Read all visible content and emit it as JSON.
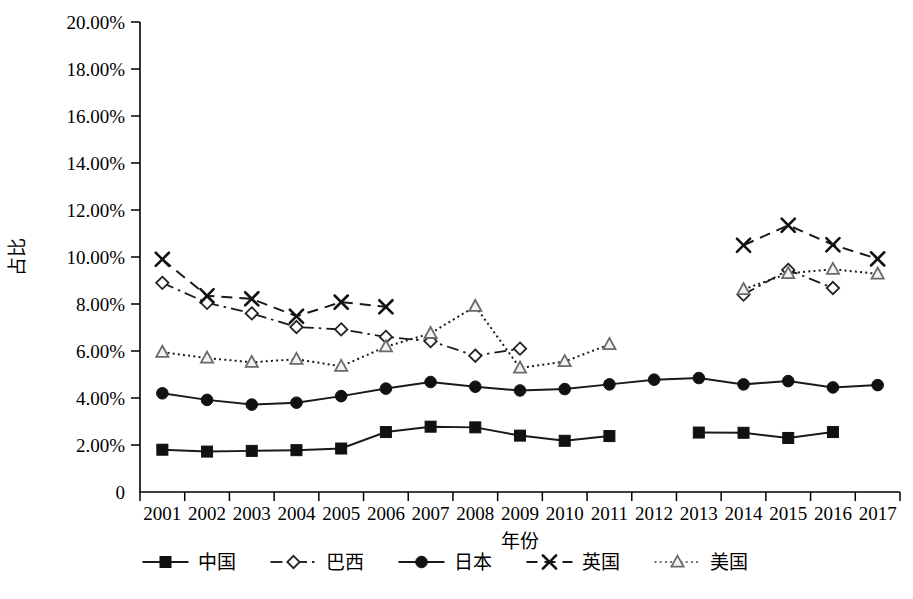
{
  "chart_data": {
    "type": "line",
    "title": "",
    "xlabel": "年份",
    "ylabel": "占比",
    "x": [
      "2001",
      "2002",
      "2003",
      "2004",
      "2005",
      "2006",
      "2007",
      "2008",
      "2009",
      "2010",
      "2011",
      "2012",
      "2013",
      "2014",
      "2015",
      "2016",
      "2017"
    ],
    "xtick_labels": [
      "2001",
      "2002",
      "2003",
      "2004",
      "2005",
      "2006",
      "2007",
      "2008",
      "2009",
      "2010",
      "2011",
      "2012",
      "2013",
      "2014",
      "2015",
      "2016",
      "2017"
    ],
    "ytick_labels": [
      "0",
      "2.00%",
      "4.00%",
      "6.00%",
      "8.00%",
      "10.00%",
      "12.00%",
      "14.00%",
      "16.00%",
      "18.00%",
      "20.00%"
    ],
    "ytick_values": [
      0,
      2,
      4,
      6,
      8,
      10,
      12,
      14,
      16,
      18,
      20
    ],
    "ylim": [
      0,
      20
    ],
    "yunit": "%",
    "grid": false,
    "legend_position": "bottom",
    "series": [
      {
        "name": "中国",
        "marker": "square-filled",
        "dash": "solid",
        "color": "#1a1a1a",
        "values": [
          1.8,
          1.72,
          1.75,
          1.78,
          1.85,
          2.55,
          2.78,
          2.75,
          2.4,
          2.18,
          2.38,
          null,
          2.53,
          2.52,
          2.3,
          2.55,
          null
        ]
      },
      {
        "name": "巴西",
        "marker": "diamond-open",
        "dash": "dashdot",
        "color": "#1a1a1a",
        "values": [
          8.9,
          8.05,
          7.6,
          7.02,
          6.92,
          6.6,
          6.42,
          5.8,
          6.1,
          null,
          null,
          null,
          null,
          8.4,
          9.45,
          8.68,
          null
        ]
      },
      {
        "name": "日本",
        "marker": "circle-filled",
        "dash": "solid",
        "color": "#1a1a1a",
        "values": [
          4.2,
          3.92,
          3.72,
          3.8,
          4.08,
          4.4,
          4.68,
          4.48,
          4.32,
          4.38,
          4.58,
          4.78,
          4.85,
          4.58,
          4.72,
          4.45,
          4.55
        ]
      },
      {
        "name": "英国",
        "marker": "cross-x",
        "dash": "dashed",
        "color": "#1a1a1a",
        "values": [
          9.9,
          8.35,
          8.22,
          7.48,
          8.08,
          7.88,
          null,
          null,
          null,
          null,
          null,
          null,
          null,
          10.5,
          11.35,
          10.52,
          9.92
        ]
      },
      {
        "name": "美国",
        "marker": "triangle-open",
        "dash": "dotted",
        "color": "#1a1a1a",
        "values": [
          5.95,
          5.7,
          5.52,
          5.65,
          5.35,
          6.18,
          6.75,
          7.9,
          5.28,
          5.55,
          6.28,
          null,
          null,
          8.62,
          9.3,
          9.48,
          9.28
        ]
      }
    ]
  },
  "legend": {
    "items": [
      {
        "label": "中国",
        "marker": "square-filled",
        "dash": "solid"
      },
      {
        "label": "巴西",
        "marker": "diamond-open",
        "dash": "dashdot"
      },
      {
        "label": "日本",
        "marker": "circle-filled",
        "dash": "solid"
      },
      {
        "label": "英国",
        "marker": "cross-x",
        "dash": "dashed"
      },
      {
        "label": "美国",
        "marker": "triangle-open",
        "dash": "dotted"
      }
    ]
  }
}
